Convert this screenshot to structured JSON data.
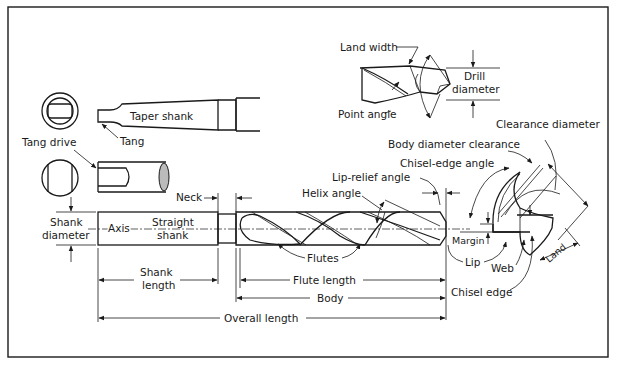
{
  "diagram": {
    "frame": {
      "border_color": "#1a1a1a",
      "background": "#ffffff"
    },
    "taper_shank_view": {
      "label_taper_shank": "Taper shank",
      "label_tang": "Tang"
    },
    "tang_drive_view": {
      "label_tang_drive": "Tang drive"
    },
    "straight_shank_drill": {
      "label_neck": "Neck",
      "label_shank_diameter_line1": "Shank",
      "label_shank_diameter_line2": "diameter",
      "label_axis": "Axis",
      "label_straight_shank_line1": "Straight",
      "label_straight_shank_line2": "shank",
      "label_helix_angle": "Helix angle",
      "label_lip_relief_angle": "Lip-relief angle",
      "label_flutes": "Flutes"
    },
    "dimensions": {
      "shank_length_line1": "Shank",
      "shank_length_line2": "length",
      "flute_length": "Flute length",
      "body": "Body",
      "overall_length": "Overall length"
    },
    "point_detail": {
      "label_land_width": "Land width",
      "label_point_angle": "Point angle",
      "label_drill_diameter_line1": "Drill",
      "label_drill_diameter_line2": "diameter"
    },
    "end_view": {
      "label_clearance_diameter": "Clearance diameter",
      "label_body_diameter_clearance": "Body diameter clearance",
      "label_chisel_edge_angle": "Chisel-edge angle",
      "label_margin": "Margin",
      "label_lip": "Lip",
      "label_web": "Web",
      "label_land": "Land",
      "label_chisel_edge": "Chisel edge"
    }
  }
}
